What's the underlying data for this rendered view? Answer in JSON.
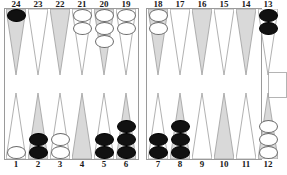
{
  "board": {
    "title": "Backgammon board position",
    "colors": {
      "black_checker": "#111111",
      "white_checker": "#ffffff",
      "triangle_shaded": "#d9d9d9",
      "triangle_plain": "#ffffff",
      "frame_line": "#9a9a9a",
      "label_text": "#1a1a1a"
    },
    "top_labels": [
      "24",
      "23",
      "22",
      "21",
      "20",
      "19",
      "18",
      "17",
      "16",
      "15",
      "14",
      "13"
    ],
    "bottom_labels": [
      "1",
      "2",
      "3",
      "4",
      "5",
      "6",
      "7",
      "8",
      "9",
      "10",
      "11",
      "12"
    ],
    "points": [
      {
        "label": "24",
        "row": "top",
        "quadrant": "left",
        "shade": "shaded",
        "checkers": 1,
        "color": "black"
      },
      {
        "label": "23",
        "row": "top",
        "quadrant": "left",
        "shade": "plain",
        "checkers": 0,
        "color": ""
      },
      {
        "label": "22",
        "row": "top",
        "quadrant": "left",
        "shade": "shaded",
        "checkers": 0,
        "color": ""
      },
      {
        "label": "21",
        "row": "top",
        "quadrant": "left",
        "shade": "plain",
        "checkers": 2,
        "color": "white"
      },
      {
        "label": "20",
        "row": "top",
        "quadrant": "left",
        "shade": "shaded",
        "checkers": 3,
        "color": "white"
      },
      {
        "label": "19",
        "row": "top",
        "quadrant": "left",
        "shade": "plain",
        "checkers": 2,
        "color": "white"
      },
      {
        "label": "18",
        "row": "top",
        "quadrant": "right",
        "shade": "shaded",
        "checkers": 2,
        "color": "white"
      },
      {
        "label": "17",
        "row": "top",
        "quadrant": "right",
        "shade": "plain",
        "checkers": 0,
        "color": ""
      },
      {
        "label": "16",
        "row": "top",
        "quadrant": "right",
        "shade": "shaded",
        "checkers": 0,
        "color": ""
      },
      {
        "label": "15",
        "row": "top",
        "quadrant": "right",
        "shade": "plain",
        "checkers": 0,
        "color": ""
      },
      {
        "label": "14",
        "row": "top",
        "quadrant": "right",
        "shade": "shaded",
        "checkers": 0,
        "color": ""
      },
      {
        "label": "13",
        "row": "top",
        "quadrant": "right",
        "shade": "plain",
        "checkers": 2,
        "color": "black"
      },
      {
        "label": "1",
        "row": "bottom",
        "quadrant": "left",
        "shade": "plain",
        "checkers": 1,
        "color": "white"
      },
      {
        "label": "2",
        "row": "bottom",
        "quadrant": "left",
        "shade": "shaded",
        "checkers": 2,
        "color": "black"
      },
      {
        "label": "3",
        "row": "bottom",
        "quadrant": "left",
        "shade": "plain",
        "checkers": 2,
        "color": "white"
      },
      {
        "label": "4",
        "row": "bottom",
        "quadrant": "left",
        "shade": "shaded",
        "checkers": 0,
        "color": ""
      },
      {
        "label": "5",
        "row": "bottom",
        "quadrant": "left",
        "shade": "plain",
        "checkers": 2,
        "color": "black"
      },
      {
        "label": "6",
        "row": "bottom",
        "quadrant": "left",
        "shade": "shaded",
        "checkers": 3,
        "color": "black"
      },
      {
        "label": "7",
        "row": "bottom",
        "quadrant": "right",
        "shade": "plain",
        "checkers": 2,
        "color": "black"
      },
      {
        "label": "8",
        "row": "bottom",
        "quadrant": "right",
        "shade": "shaded",
        "checkers": 3,
        "color": "black"
      },
      {
        "label": "9",
        "row": "bottom",
        "quadrant": "right",
        "shade": "plain",
        "checkers": 0,
        "color": ""
      },
      {
        "label": "10",
        "row": "bottom",
        "quadrant": "right",
        "shade": "shaded",
        "checkers": 0,
        "color": ""
      },
      {
        "label": "11",
        "row": "bottom",
        "quadrant": "right",
        "shade": "plain",
        "checkers": 0,
        "color": ""
      },
      {
        "label": "12",
        "row": "bottom",
        "quadrant": "right",
        "shade": "shaded",
        "checkers": 3,
        "color": "white"
      }
    ],
    "bar": {
      "black_on_bar": 0,
      "white_on_bar": 0
    },
    "bearoff_tray": {
      "visible": true,
      "checkers": 0
    },
    "caption": ""
  }
}
